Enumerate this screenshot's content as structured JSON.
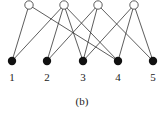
{
  "diagram": {
    "caption": "(b)",
    "top_nodes": [
      {
        "id": "a",
        "x": 29,
        "y": 5,
        "style": "open"
      },
      {
        "id": "b",
        "x": 64,
        "y": 5,
        "style": "open"
      },
      {
        "id": "c",
        "x": 98,
        "y": 5,
        "style": "open"
      },
      {
        "id": "d",
        "x": 134,
        "y": 5,
        "style": "open"
      }
    ],
    "bottom_nodes": [
      {
        "id": "1",
        "label": "1",
        "x": 12,
        "y": 61,
        "style": "filled"
      },
      {
        "id": "2",
        "label": "2",
        "x": 47,
        "y": 61,
        "style": "filled"
      },
      {
        "id": "3",
        "label": "3",
        "x": 83,
        "y": 61,
        "style": "filled"
      },
      {
        "id": "4",
        "label": "4",
        "x": 118,
        "y": 61,
        "style": "filled"
      },
      {
        "id": "5",
        "label": "5",
        "x": 153,
        "y": 61,
        "style": "filled"
      }
    ],
    "edges": [
      [
        "a",
        "1"
      ],
      [
        "a",
        "4"
      ],
      [
        "b",
        "1"
      ],
      [
        "b",
        "2"
      ],
      [
        "b",
        "3"
      ],
      [
        "b",
        "4"
      ],
      [
        "c",
        "2"
      ],
      [
        "c",
        "3"
      ],
      [
        "c",
        "5"
      ],
      [
        "d",
        "3"
      ],
      [
        "d",
        "4"
      ],
      [
        "d",
        "5"
      ]
    ],
    "colors": {
      "edge": "#333333",
      "node_fill": "#111111",
      "open_fill": "#ffffff"
    }
  }
}
